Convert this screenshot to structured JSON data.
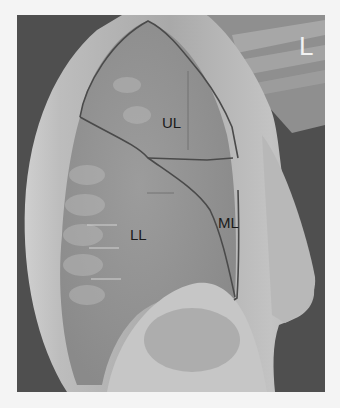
{
  "figure": {
    "side_marker": "L",
    "labels": {
      "upper_lobe": "UL",
      "middle_lobe": "ML",
      "lower_lobe": "LL"
    },
    "colors": {
      "background": "#f4f4f4",
      "outline": "#4a4a4a",
      "label_text": "#1a1a1a",
      "marker_text": "#f2f2f2"
    }
  }
}
